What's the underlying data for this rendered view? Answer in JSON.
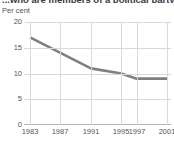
{
  "chart_data": {
    "type": "line",
    "title": "...who are members of a political party",
    "ylabel": "Per cent",
    "xlabel": "",
    "categories": [
      "1983",
      "1987",
      "1991",
      "1995",
      "1997",
      "2001"
    ],
    "x": [
      1983,
      1987,
      1991,
      1995,
      1997,
      2001
    ],
    "values": [
      17,
      14,
      11,
      10,
      9,
      9
    ],
    "series": [
      {
        "name": "Per cent",
        "values": [
          17,
          14,
          11,
          10,
          9,
          9
        ],
        "color": "#808080"
      }
    ],
    "ylim": [
      0,
      20
    ],
    "yticks": [
      0,
      5,
      10,
      15,
      20
    ],
    "ytick_labels": [
      "0",
      "5",
      "10",
      "15",
      "20"
    ],
    "xtick_labels": [
      "1983",
      "1987",
      "1991",
      "1995",
      "1997",
      "2001"
    ],
    "grid": true,
    "legend": false,
    "legend_position": "none"
  },
  "colors": {
    "line": "#808080",
    "grid": "#d9d9d9",
    "axis": "#b4b4b4",
    "text": "#555555",
    "title": "#3a3a3a",
    "background": "#ffffff"
  }
}
